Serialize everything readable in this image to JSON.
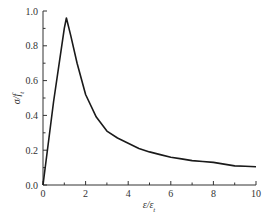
{
  "chart_data": {
    "type": "line",
    "title": "",
    "xlabel": "ε/ε_t",
    "ylabel": "σ/f_t",
    "xlim": [
      0,
      10
    ],
    "ylim": [
      0,
      1.0
    ],
    "grid": false,
    "legend": null,
    "xticks": [
      0,
      2,
      4,
      6,
      8,
      10
    ],
    "xtick_labels": [
      "0",
      "2",
      "4",
      "6",
      "8",
      "10"
    ],
    "xminor": [
      1,
      3,
      5,
      7,
      9
    ],
    "yticks": [
      0.0,
      0.2,
      0.4,
      0.6,
      0.8,
      1.0
    ],
    "ytick_labels": [
      "0.0",
      "0.2",
      "0.4",
      "0.6",
      "0.8",
      "1.0"
    ],
    "yminor": [
      0.1,
      0.3,
      0.5,
      0.7,
      0.9
    ],
    "series": [
      {
        "name": "stress-strain",
        "color": "#1a1a1a",
        "x": [
          0,
          0.5,
          1.0,
          1.1,
          1.3,
          1.6,
          2.0,
          2.5,
          3.0,
          3.5,
          4.0,
          4.5,
          5.0,
          5.5,
          6.0,
          6.5,
          7.0,
          7.5,
          8.0,
          8.5,
          9.0,
          9.5,
          10.0
        ],
        "values": [
          0.0,
          0.48,
          0.9,
          0.96,
          0.86,
          0.7,
          0.52,
          0.39,
          0.31,
          0.27,
          0.24,
          0.21,
          0.19,
          0.175,
          0.16,
          0.15,
          0.14,
          0.135,
          0.13,
          0.12,
          0.11,
          0.108,
          0.105
        ]
      }
    ]
  },
  "axes": {
    "x_label_main": "ε/ε",
    "x_label_sub": "t",
    "y_label_main": "σ/f",
    "y_label_sub": "t"
  }
}
